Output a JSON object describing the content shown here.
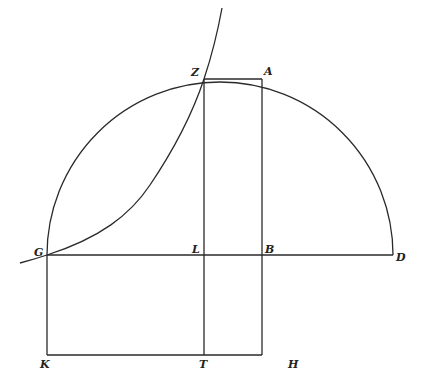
{
  "figure": {
    "type": "geometric-construction",
    "stroke_color": "#2a2a2a",
    "background": "#ffffff"
  },
  "points": {
    "Z": {
      "label": "Z",
      "x": 204,
      "y": 79
    },
    "A": {
      "label": "A",
      "x": 262,
      "y": 79
    },
    "G": {
      "label": "G",
      "x": 47,
      "y": 255
    },
    "L": {
      "label": "L",
      "x": 204,
      "y": 255
    },
    "B": {
      "label": "B",
      "x": 262,
      "y": 255
    },
    "D": {
      "label": "D",
      "x": 393,
      "y": 255
    },
    "K": {
      "label": "K",
      "x": 47,
      "y": 355
    },
    "T": {
      "label": "T",
      "x": 204,
      "y": 355
    },
    "H": {
      "label": "H",
      "x": 262,
      "y": 355
    }
  },
  "semicircle": {
    "center_x": 220,
    "center_y": 255,
    "radius": 173
  },
  "segments": [
    [
      "G",
      "D"
    ],
    [
      "Z",
      "T"
    ],
    [
      "A",
      "H"
    ],
    [
      "Z",
      "A"
    ],
    [
      "G",
      "K"
    ],
    [
      "K",
      "H"
    ]
  ]
}
